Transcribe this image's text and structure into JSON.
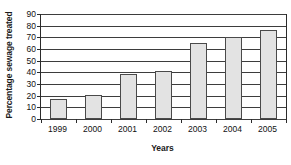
{
  "chart_data": {
    "type": "bar",
    "title": "",
    "subtitle": "",
    "xlabel": "Years",
    "ylabel": "Percentage sewage treated",
    "categories": [
      "1999",
      "2000",
      "2001",
      "2002",
      "2003",
      "2004",
      "2005"
    ],
    "values": [
      17,
      21,
      39,
      41,
      65,
      70,
      76
    ],
    "series": [
      {
        "name": "Percentage sewage treated",
        "values": [
          17,
          21,
          39,
          41,
          65,
          70,
          76
        ]
      }
    ],
    "ylim": [
      0,
      90
    ],
    "ytick_labels": [
      "0",
      "10",
      "20",
      "30",
      "40",
      "50",
      "60",
      "70",
      "80",
      "90"
    ],
    "ytick_values": [
      0,
      10,
      20,
      30,
      40,
      50,
      60,
      70,
      80,
      90
    ],
    "grid": true,
    "grid_axis": "y",
    "legend": false,
    "legend_position": "none",
    "annotations": [],
    "colors": {
      "bar_fill": "#e3e3e3",
      "bar_border": "#4a4a4a",
      "gridline": "#3d3d3d",
      "axis": "#2b2b2b",
      "text": "#111111",
      "background": "#ffffff"
    }
  }
}
